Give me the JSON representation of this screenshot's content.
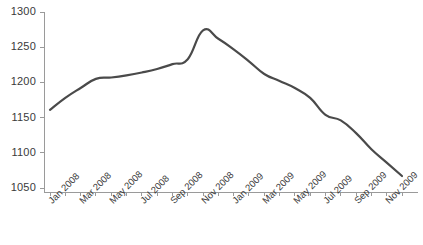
{
  "chart_data": {
    "type": "line",
    "title": "",
    "subtitle": "",
    "xlabel": "",
    "ylabel": "",
    "grid": false,
    "legend": false,
    "ylim": [
      1050,
      1300
    ],
    "yticks": [
      1050,
      1100,
      1150,
      1200,
      1250,
      1300
    ],
    "ytick_labels": [
      "1050",
      "1100",
      "1150",
      "1200",
      "1250",
      "1300"
    ],
    "x": [
      "Jan 2008",
      "Feb 2008",
      "Mar 2008",
      "Apr 2008",
      "May 2008",
      "Jun 2008",
      "Jul 2008",
      "Aug 2008",
      "Sep 2008",
      "Oct 2008",
      "Nov 2008",
      "Dec 2008",
      "Jan 2009",
      "Feb 2009",
      "Mar 2009",
      "Apr 2009",
      "May 2009",
      "Jun 2009",
      "Jul 2009",
      "Aug 2009",
      "Sep 2009",
      "Oct 2009",
      "Nov 2009",
      "Dec 2009"
    ],
    "xtick_labels": [
      "Jan 2008",
      "Mar 2008",
      "May 2008",
      "Jul 2008",
      "Sep 2008",
      "Nov 2008",
      "Jan 2009",
      "Mar 2009",
      "May 2009",
      "Jul 2009",
      "Sep 2009",
      "Nov 2009"
    ],
    "xtick_label_interval": 2,
    "series": [
      {
        "name": "series-1",
        "color": "#4a4a4a",
        "values": [
          1161,
          1178,
          1192,
          1205,
          1207,
          1210,
          1214,
          1219,
          1226,
          1233,
          1274,
          1262,
          1247,
          1230,
          1212,
          1202,
          1192,
          1178,
          1154,
          1146,
          1128,
          1105,
          1086,
          1067
        ]
      }
    ],
    "line_color": "#4a4a4a",
    "line_width": 2.2,
    "axis_color": "#9a9a9a"
  }
}
